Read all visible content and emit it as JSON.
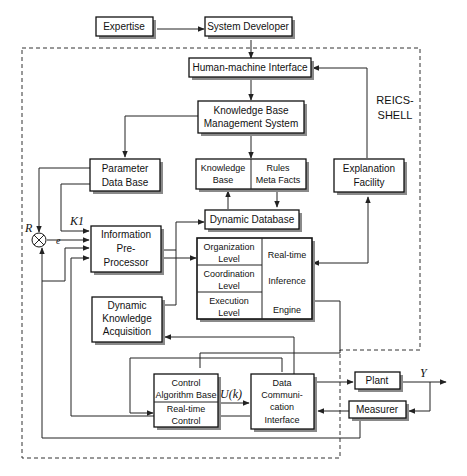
{
  "shell_label": [
    "REICS-",
    "SHELL"
  ],
  "blocks": {
    "expertise": [
      "Expertise"
    ],
    "system_developer": [
      "System Developer"
    ],
    "hmi": [
      "Human-machine Interface"
    ],
    "kbms": [
      "Knowledge Base",
      "Management System"
    ],
    "param_db": [
      "Parameter",
      "Data Base"
    ],
    "kb": [
      "Knowledge",
      "Base"
    ],
    "rules": [
      "Rules",
      "Meta Facts"
    ],
    "explanation": [
      "Explanation",
      "Facility"
    ],
    "dyn_db": [
      "Dynamic Database"
    ],
    "info_pre": [
      "Information",
      "Pre-",
      "Processor"
    ],
    "org_level": [
      "Organization",
      "Level"
    ],
    "coord_level": [
      "Coordination",
      "Level"
    ],
    "exec_level": [
      "Execution",
      "Level"
    ],
    "inference": [
      "Real-time",
      "Inference",
      "Engine"
    ],
    "dka": [
      "Dynamic",
      "Knowledge",
      "Acquisition"
    ],
    "control_alg": [
      "Control",
      "Algorithm Base"
    ],
    "rt_control": [
      "Real-time",
      "Control"
    ],
    "dci": [
      "Data",
      "Communi-",
      "cation",
      "Interface"
    ],
    "plant": [
      "Plant"
    ],
    "measurer": [
      "Measurer"
    ]
  },
  "signals": {
    "R": "R",
    "e": "e",
    "K1": "K1",
    "Uk": "U(k)",
    "Y": "Y"
  },
  "summing_junction": "⊗"
}
